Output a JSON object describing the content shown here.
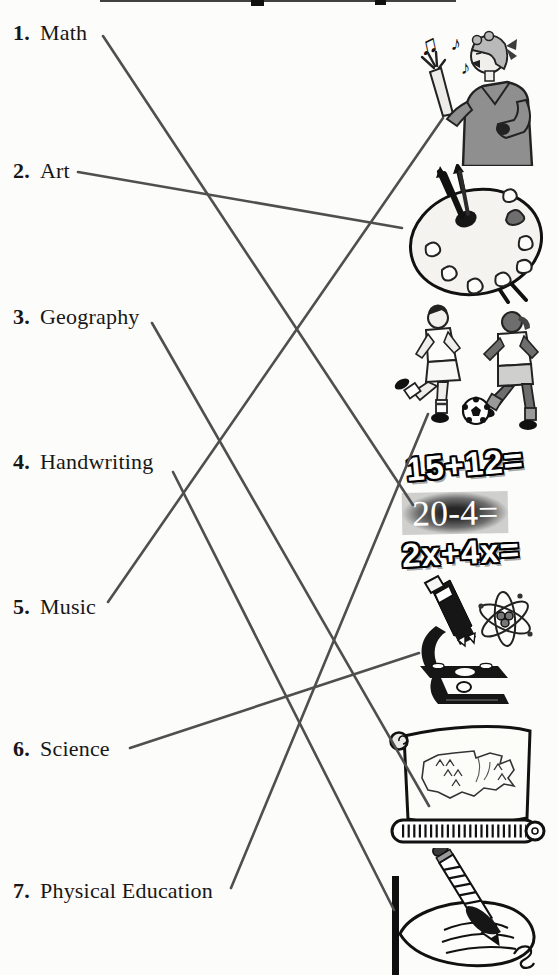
{
  "page": {
    "kind": "matching-worksheet",
    "background": "#fcfcfa",
    "line_color": "#4f4f4f",
    "ink_color": "#171717"
  },
  "subjects": [
    {
      "number": "1.",
      "label": "Math"
    },
    {
      "number": "2.",
      "label": "Art"
    },
    {
      "number": "3.",
      "label": "Geography"
    },
    {
      "number": "4.",
      "label": "Handwriting"
    },
    {
      "number": "5.",
      "label": "Music"
    },
    {
      "number": "6.",
      "label": "Science"
    },
    {
      "number": "7.",
      "label": "Physical Education"
    }
  ],
  "pictures": [
    {
      "name": "woman-singing",
      "depicts": "woman singing with music notes"
    },
    {
      "name": "paint-palette",
      "depicts": "artist palette with brushes"
    },
    {
      "name": "soccer-players",
      "depicts": "two children playing soccer"
    },
    {
      "name": "math-equations",
      "depicts": "arithmetic and algebra problems",
      "lines": [
        "15+12=",
        "20-4=",
        "2x+4x="
      ]
    },
    {
      "name": "microscope-atom",
      "depicts": "microscope and atom symbol"
    },
    {
      "name": "map-scroll",
      "depicts": "scroll map of the United States"
    },
    {
      "name": "hand-writing",
      "depicts": "hand writing with a pencil"
    }
  ],
  "connections": [
    {
      "subject": "Math",
      "picture": "math-equations"
    },
    {
      "subject": "Art",
      "picture": "paint-palette"
    },
    {
      "subject": "Geography",
      "picture": "map-scroll"
    },
    {
      "subject": "Handwriting",
      "picture": "hand-writing"
    },
    {
      "subject": "Music",
      "picture": "woman-singing"
    },
    {
      "subject": "Science",
      "picture": "microscope-atom"
    },
    {
      "subject": "Physical Education",
      "picture": "soccer-players"
    }
  ]
}
